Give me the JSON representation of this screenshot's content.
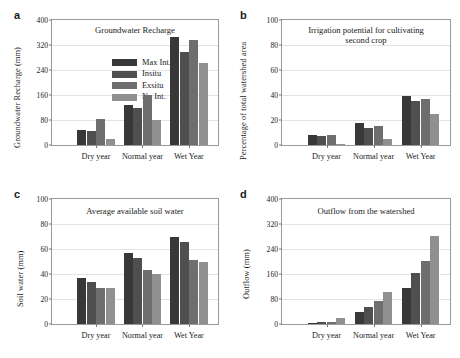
{
  "series_names": [
    "Max Int.",
    "Insitu",
    "Exsitu",
    "No Int."
  ],
  "series_colors": [
    "#383838",
    "#4f4f4f",
    "#6e6e6e",
    "#909090"
  ],
  "categories": [
    "Dry year",
    "Normal year",
    "Wet Year"
  ],
  "panels": {
    "a": {
      "letter": "a",
      "title": "Groundwater Recharge",
      "ylabel": "Groundwater Recharge (mm)",
      "yticks": [
        "0",
        "80",
        "160",
        "240",
        "320",
        "400"
      ]
    },
    "b": {
      "letter": "b",
      "title": "Irrigation potential for cultivating\nsecond crop",
      "ylabel": "Percentage of total watershed area",
      "yticks": [
        "0",
        "20",
        "40",
        "60",
        "80",
        "100"
      ]
    },
    "c": {
      "letter": "c",
      "title": "Average available soil water",
      "ylabel": "Soil water (mm)",
      "yticks": [
        "0",
        "20",
        "40",
        "60",
        "80",
        "100"
      ]
    },
    "d": {
      "letter": "d",
      "title": "Outflow from the watershed",
      "ylabel": "Outflow (mm)",
      "yticks": [
        "0",
        "80",
        "160",
        "240",
        "320",
        "400"
      ]
    }
  },
  "chart_data": [
    {
      "panel": "a",
      "type": "bar",
      "title": "Groundwater Recharge",
      "xlabel": "",
      "ylabel": "Groundwater Recharge (mm)",
      "ylim": [
        0,
        400
      ],
      "yticks": [
        0,
        80,
        160,
        240,
        320,
        400
      ],
      "grid": true,
      "legend": "inside-upper-left",
      "categories": [
        "Dry year",
        "Normal year",
        "Wet Year"
      ],
      "series": [
        {
          "name": "Max Int.",
          "values": [
            48,
            128,
            345
          ]
        },
        {
          "name": "Insitu",
          "values": [
            45,
            118,
            297
          ]
        },
        {
          "name": "Exsitu",
          "values": [
            83,
            160,
            337
          ]
        },
        {
          "name": "No Int.",
          "values": [
            20,
            80,
            262
          ]
        }
      ]
    },
    {
      "panel": "b",
      "type": "bar",
      "title": "Irrigation potential for cultivating second crop",
      "xlabel": "",
      "ylabel": "Percentage of total watershed area",
      "ylim": [
        0,
        100
      ],
      "yticks": [
        0,
        20,
        40,
        60,
        80,
        100
      ],
      "grid": true,
      "legend": "none",
      "categories": [
        "Dry year",
        "Normal year",
        "Wet Year"
      ],
      "series": [
        {
          "name": "Max Int.",
          "values": [
            8,
            18,
            39
          ]
        },
        {
          "name": "Insitu",
          "values": [
            7,
            14,
            35
          ]
        },
        {
          "name": "Exsitu",
          "values": [
            8,
            15,
            37
          ]
        },
        {
          "name": "No Int.",
          "values": [
            1,
            5,
            25
          ]
        }
      ]
    },
    {
      "panel": "c",
      "type": "bar",
      "title": "Average available soil water",
      "xlabel": "",
      "ylabel": "Soil water (mm)",
      "ylim": [
        0,
        100
      ],
      "yticks": [
        0,
        20,
        40,
        60,
        80,
        100
      ],
      "grid": true,
      "legend": "none",
      "categories": [
        "Dry year",
        "Normal year",
        "Wet Year"
      ],
      "series": [
        {
          "name": "Max Int.",
          "values": [
            37,
            57,
            70
          ]
        },
        {
          "name": "Insitu",
          "values": [
            34,
            53,
            66
          ]
        },
        {
          "name": "Exsitu",
          "values": [
            29,
            43,
            51
          ]
        },
        {
          "name": "No Int.",
          "values": [
            29,
            40,
            50
          ]
        }
      ]
    },
    {
      "panel": "d",
      "type": "bar",
      "title": "Outflow from the watershed",
      "xlabel": "",
      "ylabel": "Outflow (mm)",
      "ylim": [
        0,
        400
      ],
      "yticks": [
        0,
        80,
        160,
        240,
        320,
        400
      ],
      "grid": true,
      "legend": "none",
      "categories": [
        "Dry year",
        "Normal year",
        "Wet Year"
      ],
      "series": [
        {
          "name": "Max Int.",
          "values": [
            2,
            40,
            115
          ]
        },
        {
          "name": "Insitu",
          "values": [
            5,
            55,
            163
          ]
        },
        {
          "name": "Exsitu",
          "values": [
            8,
            73,
            203
          ]
        },
        {
          "name": "No Int.",
          "values": [
            20,
            103,
            283
          ]
        }
      ]
    }
  ]
}
